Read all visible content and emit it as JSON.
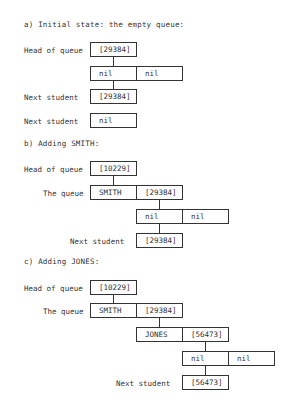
{
  "sections": {
    "a": {
      "heading": "a) Initial state: the empty queue:",
      "head_label": "Head of queue",
      "head_value": "[29384]",
      "node": [
        "nil",
        "nil"
      ],
      "next_label_1": "Next student",
      "next_value_1": "[29384]",
      "next_label_2": "Next student",
      "next_value_2": "nil"
    },
    "b": {
      "heading": "b) Adding SMITH:",
      "head_label": "Head of queue",
      "head_value": "[10229]",
      "queue_label": "The queue",
      "node1": [
        "SMITH",
        "[29384]"
      ],
      "node2": [
        "nil",
        "nil"
      ],
      "next_label": "Next student",
      "next_value": "[29384]"
    },
    "c": {
      "heading": "c) Adding JONES:",
      "head_label": "Head of queue",
      "head_value": "[10229]",
      "queue_label": "The queue",
      "node1": [
        "SMITH",
        "[29384]"
      ],
      "node2": [
        "JONES",
        "[56473]"
      ],
      "node3": [
        "nil",
        "nil"
      ],
      "next_label": "Next student",
      "next_value": "[56473]"
    }
  }
}
